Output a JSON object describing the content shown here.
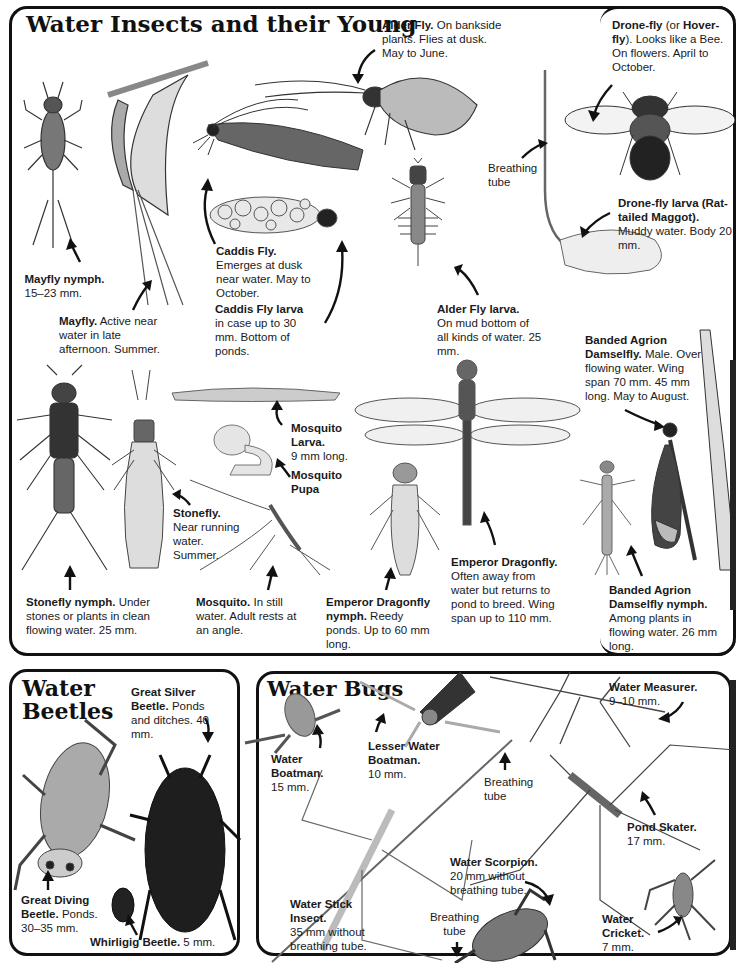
{
  "page": {
    "background": "#ffffff",
    "ink": "#111111"
  },
  "sections": {
    "insects": {
      "title": "Water Insects and their Young",
      "labels": {
        "alder_fly": {
          "name": "Alder Fly.",
          "desc": "On bankside plants. Flies at dusk. May to June."
        },
        "drone_fly": {
          "name": "Drone-fly",
          "name_extra": "(or",
          "alt_name": "Hover-fly",
          "desc": "). Looks like a Bee. On flowers. April to October."
        },
        "breathing_tube_1": {
          "text": "Breathing tube"
        },
        "drone_fly_larva": {
          "name": "Drone-fly larva (Rat-tailed Maggot).",
          "desc": "Muddy water. Body 20 mm."
        },
        "mayfly_nymph": {
          "name": "Mayfly nymph.",
          "desc": "15–23 mm."
        },
        "mayfly": {
          "name": "Mayfly.",
          "desc": "Active near water in late afternoon. Summer."
        },
        "caddis_fly": {
          "name": "Caddis Fly.",
          "desc": "Emerges at dusk near water. May to October."
        },
        "caddis_fly_larva": {
          "name": "Caddis Fly larva",
          "desc": "in case up to 30 mm. Bottom of ponds."
        },
        "alder_fly_larva": {
          "name": "Alder Fly larva.",
          "desc": "On mud bottom of all kinds of water. 25 mm."
        },
        "banded_agrion": {
          "name": "Banded Agrion Damselfly.",
          "desc": "Male. Over flowing water. Wing span 70 mm. 45 mm long. May to August."
        },
        "mosquito_larva": {
          "name": "Mosquito Larva.",
          "desc": "9 mm long."
        },
        "mosquito_pupa": {
          "name": "Mosquito Pupa",
          "desc": ""
        },
        "stonefly": {
          "name": "Stonefly.",
          "desc": "Near running water. Summer."
        },
        "stonefly_nymph": {
          "name": "Stonefly nymph.",
          "desc": "Under stones or plants in clean flowing water. 25 mm."
        },
        "mosquito": {
          "name": "Mosquito.",
          "desc": "In still water. Adult rests at an angle."
        },
        "emperor_nymph": {
          "name": "Emperor Dragonfly nymph.",
          "desc": "Reedy ponds. Up to 60 mm long."
        },
        "emperor": {
          "name": "Emperor Dragonfly.",
          "desc": "Often away from water but returns to pond to breed. Wing span up to 110 mm."
        },
        "banded_agrion_nymph": {
          "name": "Banded Agrion Damselfly nymph.",
          "desc": "Among plants in flowing water. 26 mm long."
        }
      }
    },
    "beetles": {
      "title_line1": "Water",
      "title_line2": "Beetles",
      "labels": {
        "great_silver": {
          "name": "Great Silver Beetle.",
          "desc": "Ponds and ditches. 40 mm."
        },
        "great_diving": {
          "name": "Great Diving Beetle.",
          "desc": "Ponds. 30–35 mm."
        },
        "whirligig": {
          "name": "Whirligig Beetle.",
          "desc": "5 mm."
        }
      }
    },
    "bugs": {
      "title": "Water Bugs",
      "labels": {
        "water_boatman": {
          "name": "Water Boatman.",
          "desc": "15 mm."
        },
        "lesser_water_boatman": {
          "name": "Lesser Water Boatman.",
          "desc": "10 mm."
        },
        "water_measurer": {
          "name": "Water Measurer.",
          "desc": "9–10 mm."
        },
        "breathing_tube_2": {
          "text": "Breathing tube"
        },
        "pond_skater": {
          "name": "Pond Skater.",
          "desc": "17 mm."
        },
        "water_scorpion": {
          "name": "Water Scorpion.",
          "desc": "20 mm without breathing tube."
        },
        "breathing_tube_3": {
          "text": "Breathing tube"
        },
        "water_stick_insect": {
          "name": "Water Stick Insect.",
          "desc": "35 mm without breathing tube."
        },
        "water_cricket": {
          "name": "Water Cricket.",
          "desc": "7 mm."
        }
      }
    }
  }
}
